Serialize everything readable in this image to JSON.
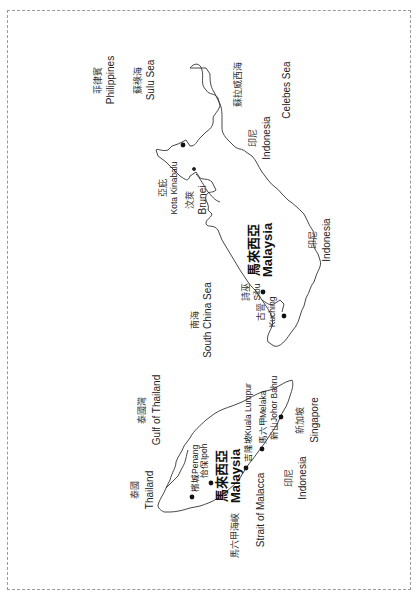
{
  "map": {
    "orientation": "rotated 90 degrees clockwise (labels read bottom-to-top)",
    "regions": {
      "philippines": {
        "zh": "菲律賓",
        "en": "Philippines"
      },
      "sulu_sea": {
        "zh": "蘇祿海",
        "en": "Sulu Sea"
      },
      "celebes_sea": {
        "zh": "蘇拉威西海",
        "en": "Celebes Sea"
      },
      "indonesia_borneo_north": {
        "zh": "印尼",
        "en": "Indonesia"
      },
      "indonesia_borneo_south": {
        "zh": "印尼",
        "en": "Indonesia"
      },
      "indonesia_sumatra": {
        "zh": "印尼",
        "en": "Indonesia"
      },
      "south_china_sea": {
        "zh": "南海",
        "en": "South China Sea"
      },
      "gulf_of_thailand": {
        "zh": "泰國灣",
        "en": "Gulf of Thailand"
      },
      "thailand": {
        "zh": "泰國",
        "en": "Thailand"
      },
      "strait_of_malacca": {
        "zh": "馬六甲海峽",
        "en": "Strait of Malacca"
      },
      "singapore": {
        "zh": "新加坡",
        "en": "Singapore"
      },
      "brunei": {
        "zh": "汶萊",
        "en": "Brunei"
      },
      "malaysia_east": {
        "zh": "馬來西亞",
        "en": "Malaysia"
      },
      "malaysia_west": {
        "zh": "馬來西亞",
        "en": "Malaysia"
      }
    },
    "cities": {
      "kota_kinabalu": {
        "zh": "亞庇",
        "en": "Kota Kinabalu"
      },
      "sibu": {
        "zh": "詩巫",
        "en": "Sibu"
      },
      "kuching": {
        "zh": "古晉",
        "en": "Kuching"
      },
      "penang": {
        "zh": "檳城",
        "en": "Penang"
      },
      "ipoh": {
        "zh": "怡保",
        "en": "Ipoh"
      },
      "kuala_lumpur": {
        "zh": "吉隆坡",
        "en": "Kuala Lumpur"
      },
      "melaka": {
        "zh": "馬六甲",
        "en": "Melaka"
      },
      "johor_bahru": {
        "zh": "新山",
        "en": "Johor Bahru"
      }
    },
    "colors": {
      "coast": "#333333",
      "text": "#222222",
      "border": "#9a9a9a"
    }
  }
}
